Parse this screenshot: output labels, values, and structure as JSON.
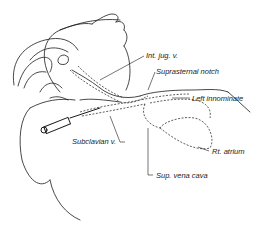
{
  "figure": {
    "labels": {
      "int_jug": "Int. jug. v.",
      "suprasternal": "Suprasternal notch",
      "left_innominate": "Left innominate",
      "subclavian": "Subclavian v.",
      "rt_atrium": "Rt. atrium",
      "svc": "Sup. vena cava"
    },
    "colors": {
      "ink": "#1a1a1a",
      "background": "#ffffff"
    }
  }
}
